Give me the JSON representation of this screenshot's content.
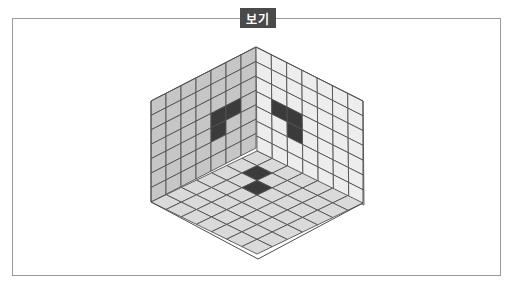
{
  "title": "보기",
  "figure": {
    "grid_size": 7,
    "vertices": {
      "top": [
        256,
        47
      ],
      "left": [
        151,
        101
      ],
      "right": [
        363,
        101
      ],
      "corner": [
        257,
        151
      ],
      "bottom_left": [
        151,
        202
      ],
      "bottom_right": [
        363,
        203
      ],
      "bottom": [
        258,
        259
      ]
    },
    "colors": {
      "left_wall": "#c6c6c6",
      "right_wall": "#ededed",
      "floor": "#dadada",
      "dark_cell": "#3b3b3b",
      "grid_line": "#505050"
    },
    "left_wall_dark_cells": [
      [
        4,
        3
      ],
      [
        5,
        3
      ],
      [
        4,
        4
      ]
    ],
    "right_wall_dark_cells": [
      [
        1,
        3
      ],
      [
        2,
        3
      ],
      [
        2,
        4
      ]
    ],
    "floor_dark_cells": [
      [
        1,
        1
      ],
      [
        2,
        2
      ]
    ]
  }
}
